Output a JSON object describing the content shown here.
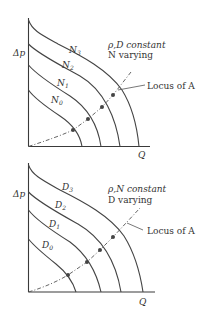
{
  "figure": {
    "panels": [
      {
        "id": "top",
        "y_label": "Δp",
        "x_label": "Q",
        "condition_line1": "ρ,D constant",
        "condition_line2": "N varying",
        "locus_label": "Locus of A",
        "curve_var": "N",
        "curves": [
          {
            "label": "N",
            "sub": "0"
          },
          {
            "label": "N",
            "sub": "1"
          },
          {
            "label": "N",
            "sub": "2"
          },
          {
            "label": "N",
            "sub": "3"
          }
        ]
      },
      {
        "id": "bottom",
        "y_label": "Δp",
        "x_label": "Q",
        "condition_line1": "ρ,N constant",
        "condition_line2": "D varying",
        "locus_label": "Locus of A",
        "curve_var": "D",
        "curves": [
          {
            "label": "D",
            "sub": "0"
          },
          {
            "label": "D",
            "sub": "1"
          },
          {
            "label": "D",
            "sub": "2"
          },
          {
            "label": "D",
            "sub": "3"
          }
        ]
      }
    ]
  }
}
